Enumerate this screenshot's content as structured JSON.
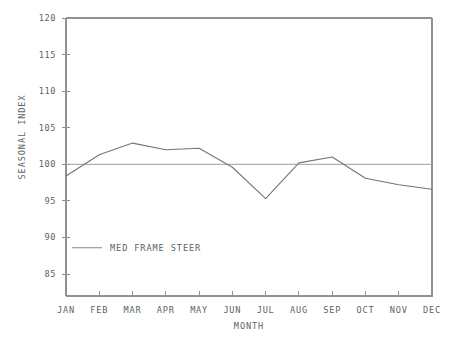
{
  "chart_data": {
    "type": "line",
    "title": "",
    "xlabel": "MONTH",
    "ylabel": "SEASONAL INDEX",
    "categories": [
      "JAN",
      "FEB",
      "MAR",
      "APR",
      "MAY",
      "JUN",
      "JUL",
      "AUG",
      "SEP",
      "OCT",
      "NOV",
      "DEC"
    ],
    "ylim": [
      82,
      120
    ],
    "ytick_labels": [
      "120",
      "115",
      "110",
      "105",
      "100",
      "95",
      "90",
      "85"
    ],
    "yticks": [
      120,
      115,
      110,
      105,
      100,
      95,
      90,
      85
    ],
    "grid": false,
    "legend_position": "inside-lower-left",
    "series": [
      {
        "name": "MED FRAME STEER",
        "values": [
          98.4,
          101.3,
          102.9,
          102.0,
          102.2,
          99.6,
          95.3,
          100.2,
          101.0,
          98.1,
          97.2,
          96.6
        ],
        "color": "#70767a"
      }
    ],
    "reference_line": {
      "name": "index-100-line",
      "value": 100,
      "color": "#9aa0a3"
    },
    "annotations": []
  },
  "legend": {
    "entries": [
      {
        "label": "MED FRAME STEER",
        "color": "#8d9295"
      }
    ]
  },
  "axes": {
    "y_title": "SEASONAL INDEX",
    "x_title": "MONTH"
  },
  "caption": {
    "text": ""
  },
  "colors": {
    "axis": "#8d9295",
    "data": "#70767a",
    "reference": "#9aa0a3",
    "text": "#5d6366",
    "background": "#ffffff"
  }
}
